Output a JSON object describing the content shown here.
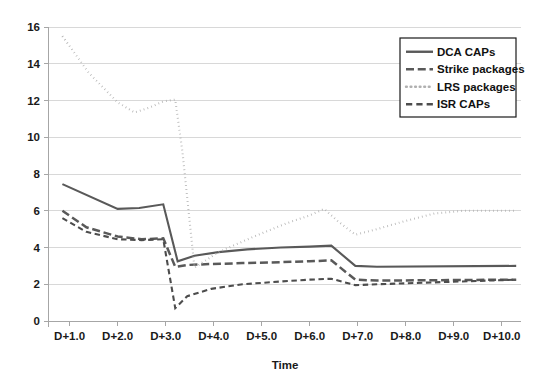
{
  "chart_data": {
    "type": "line",
    "title": "",
    "xlabel": "Time",
    "ylabel": "",
    "xlim": [
      0.55,
      10.4
    ],
    "ylim": [
      0,
      16
    ],
    "ytick_step": 2,
    "grid": true,
    "legend_position": "top-right",
    "xticks": [
      "D+1.0",
      "D+2.0",
      "D+3.0",
      "D+4.0",
      "D+5.0",
      "D+6.0",
      "D+7.0",
      "D+8.0",
      "D+9.0",
      "D+10.0"
    ],
    "xtick_values": [
      1,
      2,
      3,
      4,
      5,
      6,
      7,
      8,
      9,
      10
    ],
    "yticks": [
      "0",
      "2",
      "4",
      "6",
      "8",
      "10",
      "12",
      "14",
      "16"
    ],
    "ytick_values": [
      0,
      2,
      4,
      6,
      8,
      10,
      12,
      14,
      16
    ],
    "series": [
      {
        "name": "DCA CAPs",
        "style": "solid",
        "color": "#595959",
        "width": 2.1,
        "x": [
          0.85,
          2.0,
          2.45,
          2.95,
          3.25,
          3.6,
          4.1,
          4.7,
          5.4,
          6.0,
          6.45,
          6.95,
          7.4,
          10.3
        ],
        "y": [
          7.45,
          6.1,
          6.15,
          6.35,
          3.25,
          3.55,
          3.75,
          3.9,
          4.0,
          4.05,
          4.1,
          3.0,
          2.95,
          3.0
        ]
      },
      {
        "name": "Strike packages",
        "style": "dashed-thick",
        "color": "#595959",
        "width": 2.5,
        "x": [
          0.85,
          1.35,
          2.0,
          2.5,
          2.95,
          3.2,
          3.45,
          3.95,
          4.6,
          5.4,
          6.0,
          6.45,
          6.95,
          7.4,
          10.3
        ],
        "y": [
          6.0,
          5.1,
          4.6,
          4.45,
          4.5,
          2.95,
          3.05,
          3.1,
          3.15,
          3.2,
          3.25,
          3.3,
          2.25,
          2.2,
          2.25
        ]
      },
      {
        "name": "LRS packages",
        "style": "dotted",
        "color": "#b0b0b0",
        "width": 2.1,
        "x": [
          0.85,
          1.4,
          2.0,
          2.35,
          2.65,
          2.95,
          3.2,
          3.35,
          3.6,
          4.1,
          4.8,
          5.5,
          6.0,
          6.3,
          6.6,
          6.95,
          7.4,
          8.0,
          8.6,
          9.2,
          10.3
        ],
        "y": [
          15.5,
          13.5,
          11.9,
          11.35,
          11.6,
          11.95,
          12.05,
          9.2,
          2.9,
          3.75,
          4.55,
          5.3,
          5.75,
          6.1,
          5.4,
          4.7,
          5.0,
          5.45,
          5.85,
          6.0,
          6.0
        ]
      },
      {
        "name": "ISR CAPs",
        "style": "dashed",
        "color": "#4d4d4d",
        "width": 2.1,
        "x": [
          0.85,
          1.35,
          2.0,
          2.5,
          2.95,
          3.2,
          3.45,
          3.95,
          4.6,
          5.4,
          6.0,
          6.45,
          6.95,
          7.4,
          10.3
        ],
        "y": [
          5.6,
          4.85,
          4.45,
          4.4,
          4.45,
          0.7,
          1.35,
          1.75,
          2.0,
          2.15,
          2.25,
          2.3,
          1.95,
          2.0,
          2.25
        ]
      }
    ]
  },
  "legend": {
    "items": [
      {
        "label": "DCA CAPs"
      },
      {
        "label": "Strike packages"
      },
      {
        "label": "LRS packages"
      },
      {
        "label": "ISR CAPs"
      }
    ]
  },
  "axes": {
    "x_title": "Time"
  }
}
